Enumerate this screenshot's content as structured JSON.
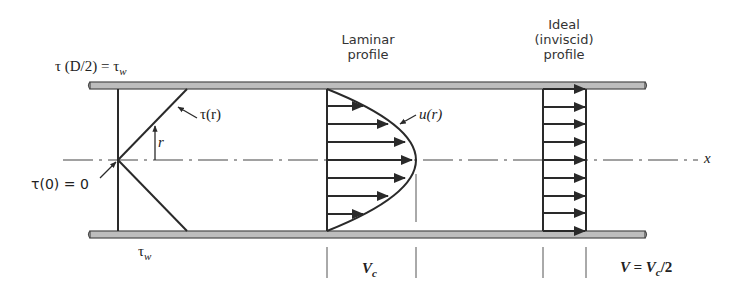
{
  "figure": {
    "colors": {
      "line": "#2a2a2a",
      "wall_fill": "#bdbdbd",
      "wall_edge": "#4a4a4a",
      "text": "#333333"
    }
  },
  "labels": {
    "wall_shear": "τ (D/2) = τ",
    "wall_shear_sub": "w",
    "shear_r": "τ(r)",
    "radius": "r",
    "center_shear": "τ(0) = 0",
    "bottom_shear": "τ",
    "bottom_shear_sub": "w",
    "laminar_line1": "Laminar",
    "laminar_line2": "profile",
    "velocity_u": "u(r)",
    "ideal_line1": "Ideal",
    "ideal_line2": "(inviscid)",
    "ideal_line3": "profile",
    "axis_x": "x",
    "centerline_velocity": "V",
    "centerline_velocity_sub": "c",
    "mean_velocity": "V = V",
    "mean_velocity_sub": "c",
    "mean_velocity_tail": "/2"
  },
  "geometry": {
    "pipe_top_y": 82,
    "pipe_bottom_y": 231,
    "wall_thickness": 7,
    "pipe_x_start": 88,
    "pipe_x_end": 646,
    "centerline_y": 160,
    "laminar_arrow_count": 9,
    "ideal_arrow_count": 9
  }
}
